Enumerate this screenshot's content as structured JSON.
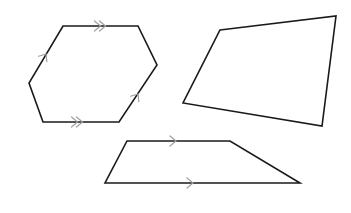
{
  "diagram": {
    "title": "",
    "colors": {
      "outline": "#1a1a1a",
      "marks": "#a0a0a0",
      "background": "#ffffff"
    },
    "shapes": [
      {
        "name": "hexagon",
        "type": "hexagon",
        "points": [
          [
            63,
            26
          ],
          [
            138,
            26
          ],
          [
            157,
            65
          ],
          [
            119,
            122
          ],
          [
            43,
            122
          ],
          [
            29,
            83
          ]
        ],
        "parallel_marks": [
          {
            "edge": "top",
            "count": 2,
            "at": [
              103,
              26
            ],
            "direction": "right"
          },
          {
            "edge": "bottom",
            "count": 2,
            "at": [
              80,
              122
            ],
            "direction": "right"
          },
          {
            "edge": "upper-left",
            "count": 1,
            "at": [
              46,
              54
            ],
            "direction": "up-right"
          },
          {
            "edge": "lower-right",
            "count": 1,
            "at": [
              138,
              94
            ],
            "direction": "up-right"
          }
        ]
      },
      {
        "name": "quadrilateral",
        "type": "quadrilateral",
        "points": [
          [
            220,
            30
          ],
          [
            336,
            16
          ],
          [
            322,
            126
          ],
          [
            183,
            103
          ]
        ],
        "parallel_marks": []
      },
      {
        "name": "trapezoid",
        "type": "trapezoid",
        "points": [
          [
            127,
            141
          ],
          [
            230,
            141
          ],
          [
            300,
            183
          ],
          [
            105,
            183
          ]
        ],
        "parallel_marks": [
          {
            "edge": "top",
            "count": 1,
            "at": [
              176,
              141
            ],
            "direction": "right"
          },
          {
            "edge": "bottom",
            "count": 1,
            "at": [
              193,
              183
            ],
            "direction": "right"
          }
        ]
      }
    ]
  }
}
